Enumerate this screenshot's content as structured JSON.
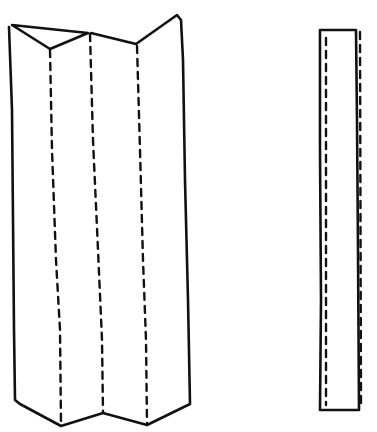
{
  "figure": {
    "ink_color": "#111111",
    "background": "#ffffff",
    "items": [
      {
        "name": "accordion-fold",
        "panels": 4,
        "fold_lines": "dashed"
      },
      {
        "name": "flat-strip",
        "fold_lines": "dashed"
      }
    ]
  }
}
